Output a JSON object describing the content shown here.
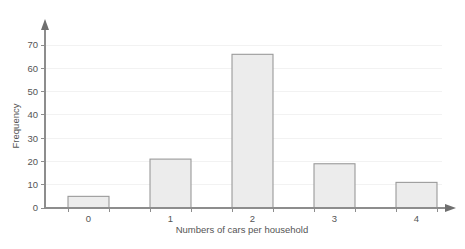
{
  "chart_data": {
    "type": "bar",
    "title": "",
    "subtitle": "",
    "xlabel": "Numbers of cars per household",
    "ylabel": "Frequency",
    "categories": [
      "0",
      "1",
      "2",
      "3",
      "4"
    ],
    "values": [
      5,
      21,
      66,
      19,
      11
    ],
    "series": [
      {
        "name": "Frequency",
        "values": [
          5,
          21,
          66,
          19,
          11
        ]
      }
    ],
    "ylim": [
      0,
      75
    ],
    "yticks": [
      0,
      10,
      20,
      30,
      40,
      50,
      60,
      70
    ],
    "ytick_labels": [
      "0",
      "10",
      "20",
      "30",
      "40",
      "50",
      "60",
      "70"
    ],
    "xtick_labels": [
      "0",
      "1",
      "2",
      "3",
      "4"
    ],
    "grid": "horizontal-faint",
    "legend": "none",
    "bar_fill_color": "#ececec",
    "bar_border_color": "#9a9a9a",
    "axis_color": "#8d8d8d",
    "gridline_color": "#f2f2f2",
    "text_color": "#555555",
    "background_color": "#ffffff",
    "axis_arrows": [
      "y-up",
      "x-right"
    ],
    "annotations": []
  },
  "axes": {
    "y_axis_label": "Frequency",
    "x_axis_label": "Numbers of cars per household"
  }
}
